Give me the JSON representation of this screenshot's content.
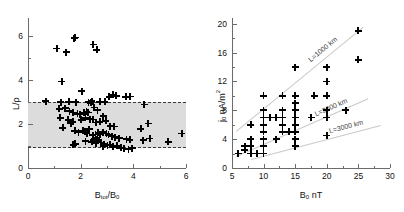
{
  "figure": {
    "background": "#ffffff",
    "marker_color": "#000000",
    "band_color": "#dcdcdc",
    "refline_color": "#c9c9c9"
  },
  "chart_data": [
    {
      "id": "left",
      "type": "scatter",
      "title": "",
      "xlabel_main": "B",
      "xlabel_sub": "tot",
      "xlabel_tail": "/B",
      "xlabel_sub2": "0",
      "ylabel_main": "L/",
      "ylabel_tail": "ρ",
      "xlim": [
        0,
        6
      ],
      "ylim": [
        0,
        6.8
      ],
      "xticks": [
        0,
        2,
        4,
        6
      ],
      "xticklabels": [
        "0",
        "2",
        "4",
        "6"
      ],
      "xminorticks": [
        1,
        3,
        5
      ],
      "yticks": [
        0,
        2,
        4,
        6
      ],
      "yticklabels": [
        "0",
        "2",
        "4",
        "6"
      ],
      "yminorticks": [
        1,
        3,
        5
      ],
      "grid": false,
      "legend": "none",
      "shaded_band": {
        "ymin": 1.0,
        "ymax": 3.0,
        "style": "dashed-border"
      },
      "points": [
        [
          1.1,
          5.42
        ],
        [
          1.45,
          5.25
        ],
        [
          1.75,
          5.88
        ],
        [
          1.8,
          5.92
        ],
        [
          2.48,
          5.6
        ],
        [
          2.62,
          5.36
        ],
        [
          1.28,
          3.92
        ],
        [
          2.05,
          3.48
        ],
        [
          0.68,
          3.02
        ],
        [
          1.25,
          2.98
        ],
        [
          1.55,
          3.0
        ],
        [
          1.82,
          2.98
        ],
        [
          2.3,
          2.98
        ],
        [
          2.38,
          2.96
        ],
        [
          2.42,
          3.02
        ],
        [
          2.72,
          3.0
        ],
        [
          2.92,
          3.0
        ],
        [
          3.08,
          3.22
        ],
        [
          3.22,
          3.32
        ],
        [
          3.35,
          3.28
        ],
        [
          3.72,
          3.22
        ],
        [
          3.88,
          3.24
        ],
        [
          4.42,
          2.88
        ],
        [
          1.18,
          2.68
        ],
        [
          1.42,
          2.72
        ],
        [
          1.58,
          2.58
        ],
        [
          1.72,
          2.52
        ],
        [
          1.88,
          2.46
        ],
        [
          1.96,
          2.44
        ],
        [
          2.12,
          2.5
        ],
        [
          2.22,
          2.56
        ],
        [
          2.28,
          2.52
        ],
        [
          2.52,
          2.74
        ],
        [
          2.64,
          2.62
        ],
        [
          2.86,
          2.34
        ],
        [
          1.22,
          2.28
        ],
        [
          1.32,
          1.82
        ],
        [
          1.52,
          2.18
        ],
        [
          1.62,
          2.02
        ],
        [
          1.7,
          2.1
        ],
        [
          2.02,
          2.18
        ],
        [
          2.18,
          2.28
        ],
        [
          2.34,
          2.22
        ],
        [
          2.48,
          2.2
        ],
        [
          2.58,
          2.06
        ],
        [
          2.72,
          2.1
        ],
        [
          2.96,
          2.14
        ],
        [
          3.12,
          1.9
        ],
        [
          3.28,
          1.88
        ],
        [
          4.28,
          1.78
        ],
        [
          4.56,
          2.02
        ],
        [
          1.78,
          1.68
        ],
        [
          1.92,
          1.62
        ],
        [
          2.08,
          1.7
        ],
        [
          2.16,
          1.66
        ],
        [
          2.24,
          1.58
        ],
        [
          2.32,
          1.76
        ],
        [
          2.46,
          1.48
        ],
        [
          2.56,
          1.52
        ],
        [
          2.66,
          1.6
        ],
        [
          2.74,
          1.54
        ],
        [
          2.86,
          1.62
        ],
        [
          2.98,
          1.56
        ],
        [
          3.06,
          1.5
        ],
        [
          3.18,
          1.44
        ],
        [
          3.3,
          1.4
        ],
        [
          3.46,
          1.36
        ],
        [
          3.74,
          1.3
        ],
        [
          3.86,
          1.28
        ],
        [
          4.38,
          1.26
        ],
        [
          4.62,
          1.34
        ],
        [
          5.32,
          1.18
        ],
        [
          5.84,
          1.56
        ],
        [
          1.72,
          1.06
        ],
        [
          1.8,
          1.1
        ],
        [
          2.18,
          1.22
        ],
        [
          2.42,
          1.18
        ],
        [
          2.58,
          1.12
        ],
        [
          2.68,
          1.24
        ],
        [
          2.78,
          1.16
        ],
        [
          2.88,
          1.08
        ],
        [
          3.02,
          1.02
        ],
        [
          3.12,
          1.06
        ],
        [
          3.22,
          0.96
        ],
        [
          3.38,
          1.0
        ],
        [
          3.52,
          0.92
        ],
        [
          3.66,
          0.88
        ],
        [
          3.82,
          0.86
        ],
        [
          3.96,
          0.9
        ],
        [
          2.86,
          0.98
        ],
        [
          2.62,
          1.3
        ],
        [
          2.5,
          1.26
        ]
      ]
    },
    {
      "id": "right",
      "type": "scatter",
      "title": "",
      "xlabel_main": "B",
      "xlabel_sub": "0",
      "xlabel_tail": " nT",
      "ylabel_main": "j",
      "ylabel_sub": "0",
      "ylabel_tail": " nA/m",
      "ylabel_sup": "2",
      "xlim": [
        5,
        30
      ],
      "ylim": [
        0,
        20.8
      ],
      "xticks": [
        5,
        10,
        15,
        20,
        25,
        30
      ],
      "xticklabels": [
        "5",
        "10",
        "15",
        "20",
        "25",
        "30"
      ],
      "xminorticks": [
        7.5,
        12.5,
        17.5,
        22.5,
        27.5
      ],
      "yticks": [
        0,
        4,
        8,
        12,
        16,
        20
      ],
      "yticklabels": [
        "0",
        "4",
        "8",
        "12",
        "16",
        "20"
      ],
      "yminorticks": [
        2,
        6,
        10,
        14,
        18
      ],
      "grid": false,
      "legend": "none",
      "points": [
        [
          6,
          2
        ],
        [
          7,
          2.5
        ],
        [
          7,
          3
        ],
        [
          8,
          2
        ],
        [
          8,
          3
        ],
        [
          8,
          4
        ],
        [
          8,
          6
        ],
        [
          9,
          2
        ],
        [
          10,
          2
        ],
        [
          10,
          3
        ],
        [
          10,
          4
        ],
        [
          10,
          5
        ],
        [
          10,
          6
        ],
        [
          10,
          7
        ],
        [
          10,
          8
        ],
        [
          10,
          10
        ],
        [
          11,
          7
        ],
        [
          12,
          4
        ],
        [
          12,
          7
        ],
        [
          13,
          5
        ],
        [
          13,
          6
        ],
        [
          13,
          7
        ],
        [
          13,
          8
        ],
        [
          13,
          10
        ],
        [
          14,
          5
        ],
        [
          14,
          5
        ],
        [
          15,
          3
        ],
        [
          15,
          4
        ],
        [
          15,
          5
        ],
        [
          15,
          6
        ],
        [
          15,
          7
        ],
        [
          15,
          8
        ],
        [
          15,
          8
        ],
        [
          15,
          9
        ],
        [
          15,
          10
        ],
        [
          15,
          14
        ],
        [
          17.5,
          7
        ],
        [
          18,
          10
        ],
        [
          20,
          4.5
        ],
        [
          20,
          7
        ],
        [
          20,
          8
        ],
        [
          20,
          10
        ],
        [
          20,
          12
        ],
        [
          20,
          14
        ],
        [
          23,
          8
        ],
        [
          25,
          15
        ],
        [
          25,
          19
        ]
      ],
      "reference_lines": [
        {
          "label": "L=1000 km",
          "x0": 5.6,
          "y0": 5.2,
          "x1": 25.6,
          "y1": 19.6
        },
        {
          "label": "L=2000 km",
          "x0": 5.6,
          "y0": 1.6,
          "x1": 26.5,
          "y1": 9.6
        },
        {
          "label": "L=3000 km",
          "x0": 8.0,
          "y0": 1.2,
          "x1": 28.5,
          "y1": 5.9
        }
      ]
    }
  ]
}
